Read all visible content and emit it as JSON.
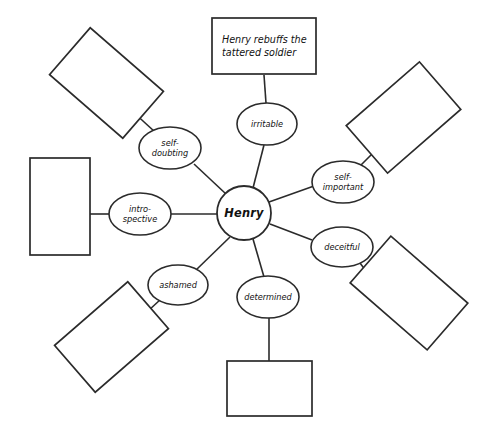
{
  "diagram": {
    "type": "spider-map",
    "title_text": "",
    "center": {
      "label": "Henry",
      "shape": "circle",
      "cx": 244,
      "cy": 213,
      "r": 27
    },
    "colors": {
      "background": "#ffffff",
      "stroke": "#2b2b2b",
      "text": "#111111",
      "fill": "#ffffff"
    },
    "nodes": [
      {
        "id": "irritable",
        "label": "irritable",
        "lines": [
          "irritable"
        ],
        "cx": 267,
        "cy": 124,
        "rx": 30,
        "ry": 21
      },
      {
        "id": "self-important",
        "label": "self-important",
        "lines": [
          "self-",
          "important"
        ],
        "cx": 343,
        "cy": 182,
        "rx": 31,
        "ry": 21
      },
      {
        "id": "deceitful",
        "label": "deceitful",
        "lines": [
          "deceitful"
        ],
        "cx": 342,
        "cy": 247,
        "rx": 31,
        "ry": 20
      },
      {
        "id": "determined",
        "label": "determined",
        "lines": [
          "determined"
        ],
        "cx": 268,
        "cy": 297,
        "rx": 31,
        "ry": 21
      },
      {
        "id": "ashamed",
        "label": "ashamed",
        "lines": [
          "ashamed"
        ],
        "cx": 178,
        "cy": 285,
        "rx": 30,
        "ry": 20
      },
      {
        "id": "introspective",
        "label": "intro-spective",
        "lines": [
          "intro-",
          "spective"
        ],
        "cx": 140,
        "cy": 214,
        "rx": 31,
        "ry": 21
      },
      {
        "id": "self-doubting",
        "label": "self-doubting",
        "lines": [
          "self-",
          "doubting"
        ],
        "cx": 170,
        "cy": 148,
        "rx": 31,
        "ry": 21
      }
    ],
    "boxes": [
      {
        "id": "box-irritable",
        "for_node": "irritable",
        "text": "Henry rebuffs the tattered soldier",
        "text_lines": [
          "Henry rebuffs the",
          "tattered soldier"
        ],
        "x": 212,
        "y": 18,
        "w": 104,
        "h": 56,
        "rotate": 0,
        "empty": false
      },
      {
        "id": "box-self-important",
        "for_node": "self-important",
        "text": "",
        "text_lines": [],
        "x": 355,
        "y": 86,
        "w": 97,
        "h": 63,
        "rotate": -41,
        "empty": true
      },
      {
        "id": "box-deceitful",
        "for_node": "deceitful",
        "text": "",
        "text_lines": [],
        "x": 358,
        "y": 262,
        "w": 102,
        "h": 62,
        "rotate": 41,
        "empty": true
      },
      {
        "id": "box-determined",
        "for_node": "determined",
        "text": "",
        "text_lines": [],
        "x": 227,
        "y": 361,
        "w": 85,
        "h": 55,
        "rotate": 0,
        "empty": true
      },
      {
        "id": "box-ashamed",
        "for_node": "ashamed",
        "text": "",
        "text_lines": [],
        "x": 63,
        "y": 306,
        "w": 97,
        "h": 62,
        "rotate": -41,
        "empty": true
      },
      {
        "id": "box-introspective",
        "for_node": "introspective",
        "text": "",
        "text_lines": [],
        "x": 30,
        "y": 158,
        "w": 60,
        "h": 97,
        "rotate": 0,
        "empty": true
      },
      {
        "id": "box-self-doubting",
        "for_node": "self-doubting",
        "text": "",
        "text_lines": [],
        "x": 58,
        "y": 52,
        "w": 97,
        "h": 62,
        "rotate": 41,
        "empty": true
      }
    ],
    "edges_center_to_node": [
      {
        "id": "edge-center-irritable",
        "x1": 253,
        "y1": 188,
        "x2": 264,
        "y2": 145
      },
      {
        "id": "edge-center-self-important",
        "x1": 269,
        "y1": 202,
        "x2": 314,
        "y2": 186
      },
      {
        "id": "edge-center-deceitful",
        "x1": 270,
        "y1": 224,
        "x2": 312,
        "y2": 240
      },
      {
        "id": "edge-center-determined",
        "x1": 253,
        "y1": 239,
        "x2": 264,
        "y2": 277
      },
      {
        "id": "edge-center-ashamed",
        "x1": 230,
        "y1": 237,
        "x2": 196,
        "y2": 270
      },
      {
        "id": "edge-center-introspective",
        "x1": 217,
        "y1": 214,
        "x2": 171,
        "y2": 214
      },
      {
        "id": "edge-center-self-doubting",
        "x1": 226,
        "y1": 194,
        "x2": 194,
        "y2": 164
      }
    ],
    "edges_node_to_box": [
      {
        "id": "edge-irritable-box",
        "x1": 266,
        "y1": 103,
        "x2": 264,
        "y2": 75
      },
      {
        "id": "edge-self-important-box",
        "x1": 360,
        "y1": 166,
        "x2": 374,
        "y2": 152
      },
      {
        "id": "edge-deceitful-box",
        "x1": 360,
        "y1": 263,
        "x2": 375,
        "y2": 283
      },
      {
        "id": "edge-determined-box",
        "x1": 269,
        "y1": 318,
        "x2": 269,
        "y2": 361
      },
      {
        "id": "edge-ashamed-box",
        "x1": 161,
        "y1": 299,
        "x2": 135,
        "y2": 323
      },
      {
        "id": "edge-introspective-box",
        "x1": 109,
        "y1": 214,
        "x2": 90,
        "y2": 214
      },
      {
        "id": "edge-self-doubting-box",
        "x1": 155,
        "y1": 132,
        "x2": 131,
        "y2": 110
      }
    ]
  }
}
